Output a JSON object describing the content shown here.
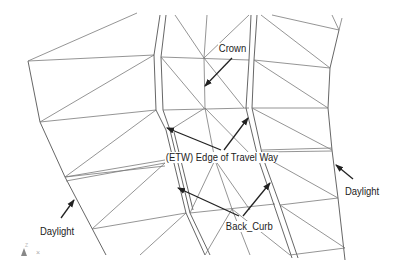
{
  "diagram": {
    "type": "TIN surface plan view (roadway corridor)",
    "colors": {
      "tin_line": "#7a7a7a",
      "leader": "#222222",
      "text": "#222222",
      "background": "#ffffff"
    },
    "labels": [
      {
        "id": "crown",
        "text": "Crown",
        "x": 218,
        "y": 43
      },
      {
        "id": "etw",
        "text": "(ETW) Edge of Travel Way",
        "x": 165,
        "y": 152
      },
      {
        "id": "daylight-right",
        "text": "Daylight",
        "x": 345,
        "y": 186
      },
      {
        "id": "daylight-left",
        "text": "Daylight",
        "x": 40,
        "y": 226
      },
      {
        "id": "back-curb",
        "text": "Back_Curb",
        "x": 225,
        "y": 221
      }
    ],
    "ucs_icon": {
      "z_label": "Z",
      "x_label": "×"
    }
  }
}
